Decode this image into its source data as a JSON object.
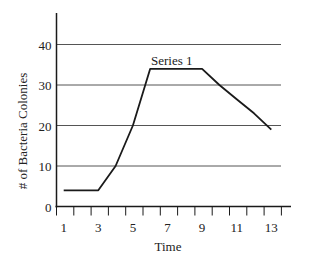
{
  "chart_data": {
    "type": "line",
    "title": "",
    "xlabel": "Time",
    "ylabel": "# of Bacteria Colonies",
    "x_tick_labels": [
      "1",
      "3",
      "5",
      "7",
      "9",
      "11",
      "13"
    ],
    "y_tick_labels": [
      "0",
      "10",
      "20",
      "30",
      "40"
    ],
    "ylim": [
      0,
      47
    ],
    "xlim": [
      1,
      13
    ],
    "grid": {
      "horizontal": true,
      "vertical": false,
      "y_values": [
        10,
        20,
        30,
        40
      ]
    },
    "legend": {
      "position": "inline-label",
      "entries": [
        "Series 1"
      ]
    },
    "annotations": [
      {
        "text": "Series 1",
        "near_x": 7.5,
        "near_y": 36
      }
    ],
    "x": [
      1,
      2,
      3,
      4,
      5,
      6,
      7,
      8,
      9,
      10,
      11,
      12,
      13
    ],
    "series": [
      {
        "name": "Series 1",
        "values": [
          4,
          4,
          4,
          10,
          20,
          34,
          34,
          34,
          34,
          30,
          26.5,
          23,
          19
        ],
        "color": "#1a1a1a"
      }
    ]
  },
  "style": {
    "axis_color": "#1a1a1a",
    "grid_color": "#555555",
    "line_color": "#1a1a1a"
  }
}
